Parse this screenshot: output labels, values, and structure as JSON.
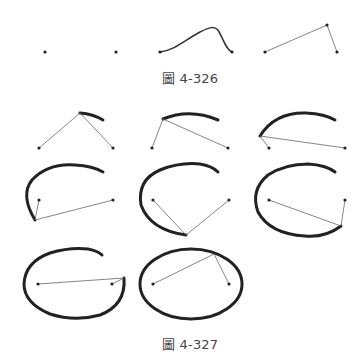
{
  "figures": [
    {
      "id": "fig-4-326",
      "caption": "圖 4-326",
      "panels": [
        {
          "name": "two-points",
          "points": [
            [
              45,
              52
            ],
            [
              116,
              52
            ]
          ]
        },
        {
          "name": "bezier-curve",
          "start": [
            160,
            52
          ],
          "end": [
            232,
            52
          ]
        },
        {
          "name": "control-polyline",
          "points": [
            [
              265,
              52
            ],
            [
              327,
              25
            ],
            [
              337,
              52
            ]
          ]
        }
      ]
    },
    {
      "id": "fig-4-327",
      "caption": "圖 4-327",
      "panels": [
        {
          "name": "step-1",
          "foci": [
            [
              39,
              148
            ],
            [
              113,
              148
            ]
          ],
          "pen": [
            80,
            113
          ]
        },
        {
          "name": "step-2",
          "foci": [
            [
              152,
              148
            ],
            [
              228,
              148
            ]
          ],
          "pen": [
            163,
            119
          ]
        },
        {
          "name": "step-3",
          "foci": [
            [
              269,
              148
            ],
            [
              345,
              148
            ]
          ],
          "pen": [
            260,
            136
          ]
        },
        {
          "name": "step-4",
          "foci": [
            [
              39,
              200
            ],
            [
              113,
              200
            ]
          ],
          "pen": [
            35,
            220
          ]
        },
        {
          "name": "step-5",
          "foci": [
            [
              153,
              200
            ],
            [
              229,
              200
            ]
          ],
          "pen": [
            186,
            235
          ]
        },
        {
          "name": "step-6",
          "foci": [
            [
              269,
              200
            ],
            [
              345,
              200
            ]
          ],
          "pen": [
            341,
            226
          ]
        },
        {
          "name": "step-7",
          "foci": [
            [
              38,
              284
            ],
            [
              112,
              284
            ]
          ],
          "pen": [
            124,
            278
          ]
        },
        {
          "name": "step-8",
          "foci": [
            [
              153,
              284
            ],
            [
              229,
              284
            ]
          ],
          "pen": [
            214,
            254
          ]
        }
      ]
    }
  ],
  "colors": {
    "stroke": "#222222",
    "string": "#666666",
    "caption": "#444444"
  }
}
